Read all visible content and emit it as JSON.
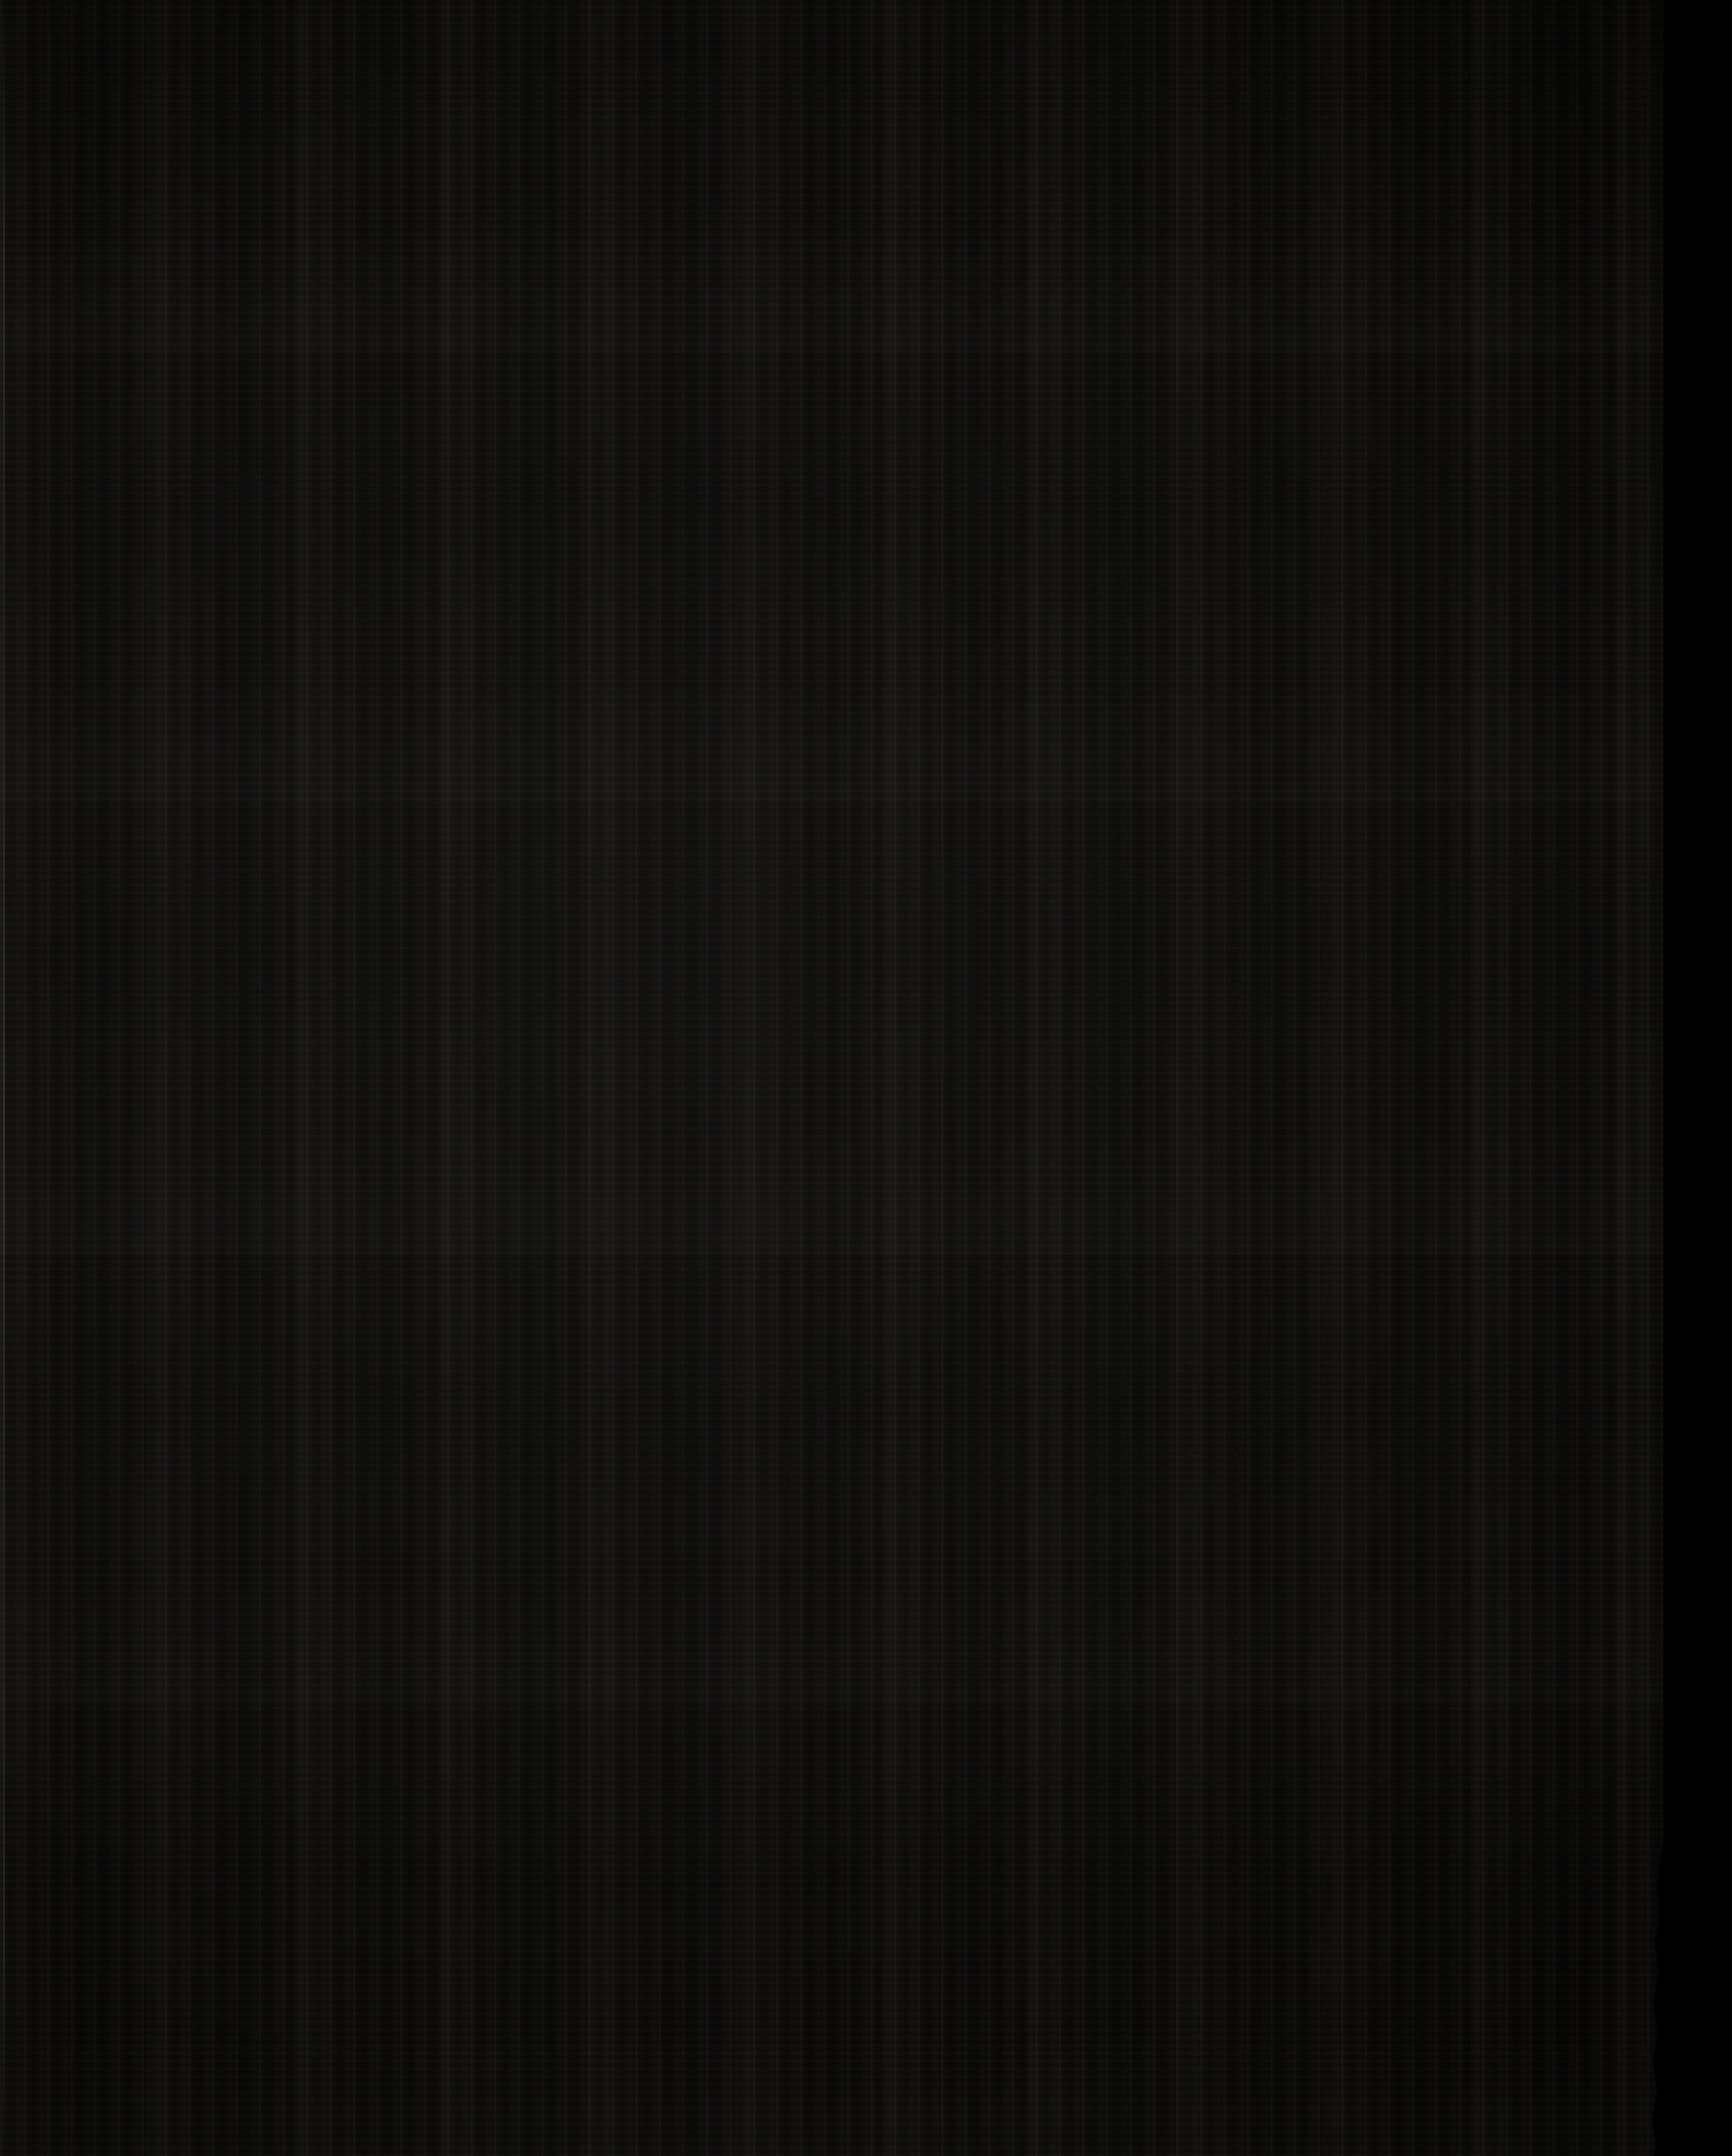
{
  "document": {
    "kind": "scanned-page",
    "subject": "blank dark textile cover / verso",
    "caption": "",
    "visible_text": "",
    "page_number": "",
    "width_px": 1767,
    "height_px": 2200
  },
  "regions": {
    "material": {
      "name": "dark woven textile page",
      "label": "",
      "base_color": "#0b0a09",
      "highlight_color": "#1a1816",
      "shadow_color": "#000000",
      "left_px": 0,
      "top_px": 0,
      "width_px": 1712,
      "height_px": 2200,
      "texture": "vertical-rib-weave"
    },
    "torn_edge": {
      "name": "torn fibrous paper edge",
      "label": "",
      "color": "#ffffff",
      "dim_color": "#8c8c8c",
      "left_px": 1700,
      "width_px": 58,
      "widest_at_top_px": 45,
      "narrow_mid_px": 7,
      "fades_below_y_px": 1950
    },
    "void": {
      "name": "scanner background void",
      "label": "",
      "color": "#000000",
      "left_px": 1748,
      "width_px": 19
    },
    "left_edge": {
      "name": "left cut edge highlight",
      "label": "",
      "color": "#4a4a4a",
      "left_px": 3,
      "width_px": 2
    }
  },
  "palette": {
    "background": "#000000",
    "material_base": "#0b0a09",
    "material_light": "#1a1816",
    "torn_white": "#ffffff",
    "torn_grey": "#8c8c8c",
    "edge_line": "#4a4a4a"
  },
  "annotations": {
    "title": "",
    "notes": ""
  }
}
